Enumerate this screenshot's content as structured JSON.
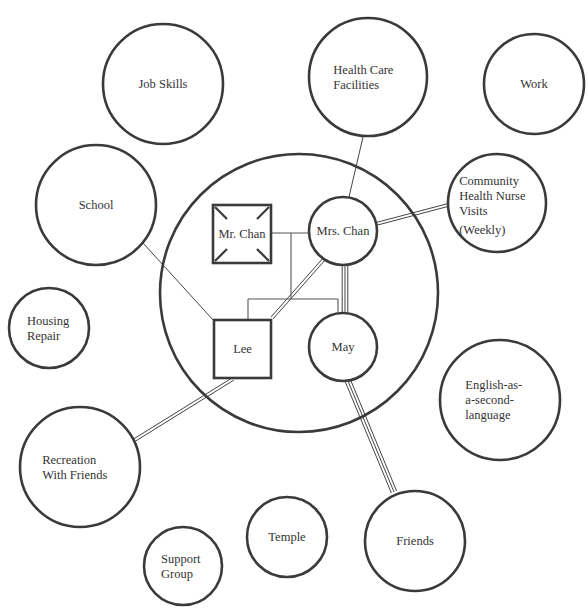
{
  "diagram": {
    "type": "ecomap",
    "family_circle": {
      "cx": 299,
      "cy": 293,
      "r": 139
    },
    "colors": {
      "stroke": "#3a3a3a",
      "text": "#333333",
      "background": "#ffffff"
    }
  },
  "family_members": [
    {
      "id": "mr_chan",
      "label": "Mr. Chan",
      "shape": "square-deceased",
      "x": 213,
      "y": 205,
      "w": 58,
      "h": 58
    },
    {
      "id": "mrs_chan",
      "label": "Mrs. Chan",
      "shape": "circle",
      "cx": 343,
      "cy": 231,
      "r": 34
    },
    {
      "id": "lee",
      "label": "Lee",
      "shape": "square",
      "x": 214,
      "y": 320,
      "w": 57,
      "h": 58
    },
    {
      "id": "may",
      "label": "May",
      "shape": "circle",
      "cx": 343,
      "cy": 347,
      "r": 34
    }
  ],
  "systems": [
    {
      "id": "job_skills",
      "lines": [
        "Job Skills"
      ],
      "cx": 163,
      "cy": 84,
      "r": 60
    },
    {
      "id": "health_care",
      "lines": [
        "Health Care",
        "Facilities"
      ],
      "cx": 368,
      "cy": 77,
      "r": 59
    },
    {
      "id": "work",
      "lines": [
        "Work"
      ],
      "cx": 534,
      "cy": 84,
      "r": 50
    },
    {
      "id": "school",
      "lines": [
        "School"
      ],
      "cx": 96,
      "cy": 205,
      "r": 60
    },
    {
      "id": "chn",
      "lines": [
        "Community",
        "Health Nurse",
        "Visits",
        "(Weekly)"
      ],
      "cx": 497,
      "cy": 203,
      "r": 49
    },
    {
      "id": "housing",
      "lines": [
        "Housing",
        "Repair"
      ],
      "cx": 49,
      "cy": 328,
      "r": 40
    },
    {
      "id": "esl",
      "lines": [
        "English-as-",
        "a-second-",
        "language"
      ],
      "cx": 500,
      "cy": 400,
      "r": 60
    },
    {
      "id": "recreation",
      "lines": [
        "Recreation",
        "With Friends"
      ],
      "cx": 80,
      "cy": 467,
      "r": 60
    },
    {
      "id": "temple",
      "lines": [
        "Temple"
      ],
      "cx": 287,
      "cy": 537,
      "r": 40
    },
    {
      "id": "friends",
      "lines": [
        "Friends"
      ],
      "cx": 415,
      "cy": 541,
      "r": 50
    },
    {
      "id": "support",
      "lines": [
        "Support",
        "Group"
      ],
      "cx": 183,
      "cy": 566,
      "r": 39
    }
  ],
  "connections": [
    {
      "from": "health_care",
      "to": "mrs_chan",
      "type": "normal",
      "x1": 363,
      "y1": 137,
      "x2": 349,
      "y2": 197
    },
    {
      "from": "school",
      "to": "lee",
      "type": "normal",
      "x1": 143,
      "y1": 243,
      "x2": 214,
      "y2": 321
    },
    {
      "from": "mrs_chan",
      "to": "chn",
      "type": "strong",
      "x1": 376,
      "y1": 224,
      "x2": 448,
      "y2": 205
    },
    {
      "from": "mrs_chan",
      "to": "lee",
      "type": "strong",
      "x1": 325,
      "y1": 258,
      "x2": 272,
      "y2": 318
    },
    {
      "from": "mrs_chan",
      "to": "may",
      "type": "very-strong",
      "x1": 345,
      "y1": 265,
      "x2": 345,
      "y2": 313
    },
    {
      "from": "lee",
      "to": "recreation",
      "type": "strong",
      "x1": 233,
      "y1": 379,
      "x2": 133,
      "y2": 441
    },
    {
      "from": "may",
      "to": "friends",
      "type": "very-strong",
      "x1": 348,
      "y1": 381,
      "x2": 394,
      "y2": 492
    }
  ],
  "legend_semantics": {
    "normal": "single line",
    "strong": "double line",
    "very-strong": "triple line"
  }
}
